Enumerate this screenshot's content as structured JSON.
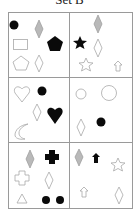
{
  "title": "Set B",
  "colors": {
    "frame": "#9a9a9a",
    "outline": "#a8a8a8",
    "fill_black": "#0a0a0a",
    "fill_gray": "#b9b9b9"
  },
  "cells": [
    {
      "id": "top-left",
      "shapes": [
        "black-circle",
        "gray-diamond",
        "outline-rectangle",
        "black-pentagon",
        "outline-pentagon",
        "outline-diamond"
      ]
    },
    {
      "id": "top-right",
      "shapes": [
        "gray-diamond",
        "black-star",
        "outline-diamond",
        "outline-star",
        "outline-arrow-up"
      ]
    },
    {
      "id": "middle-left",
      "shapes": [
        "outline-heart",
        "black-circle",
        "outline-diamond",
        "black-heart",
        "outline-crescent"
      ]
    },
    {
      "id": "middle-right",
      "shapes": [
        "outline-circle-small",
        "outline-circle-large",
        "outline-diamond",
        "black-circle"
      ]
    },
    {
      "id": "bottom-left",
      "shapes": [
        "gray-diamond",
        "black-cross",
        "outline-cross",
        "outline-diamond",
        "outline-triangle",
        "black-circle",
        "black-circle"
      ]
    },
    {
      "id": "bottom-right",
      "shapes": [
        "gray-diamond",
        "black-arrow-up",
        "outline-star",
        "outline-arrow-up",
        "outline-diamond"
      ]
    }
  ]
}
